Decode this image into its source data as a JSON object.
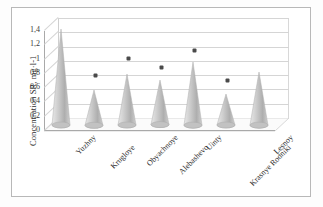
{
  "chart_data": {
    "type": "bar",
    "title": "",
    "subtitle": "",
    "xlabel": "",
    "ylabel": "Concentration SR, mg·l-1",
    "ylim": [
      0,
      1.4
    ],
    "yticks": [
      "0",
      "0,2",
      "0,4",
      "0,6",
      "0,8",
      "1",
      "1,2",
      "1,4"
    ],
    "ytick_values": [
      0,
      0.2,
      0.4,
      0.6,
      0.8,
      1.0,
      1.2,
      1.4
    ],
    "grid": true,
    "legend": "none",
    "style": "3d-cone",
    "categories": [
      "Yuzhny",
      "Krugloye",
      "Obyachnoye",
      "Alebashevo",
      "Uinty",
      "Krasnye Rodniki",
      "Lesnoy"
    ],
    "series": [
      {
        "name": "Concentration SR",
        "marker": "cone",
        "color": "#b9b9b9",
        "values": [
          1.33,
          0.48,
          0.7,
          0.61,
          0.87,
          0.42,
          0.73
        ]
      },
      {
        "name": "Marker points",
        "marker": "asterisk",
        "color": "#4a4a4a",
        "values": [
          null,
          0.72,
          0.96,
          0.84,
          1.07,
          0.65,
          null
        ]
      }
    ]
  }
}
